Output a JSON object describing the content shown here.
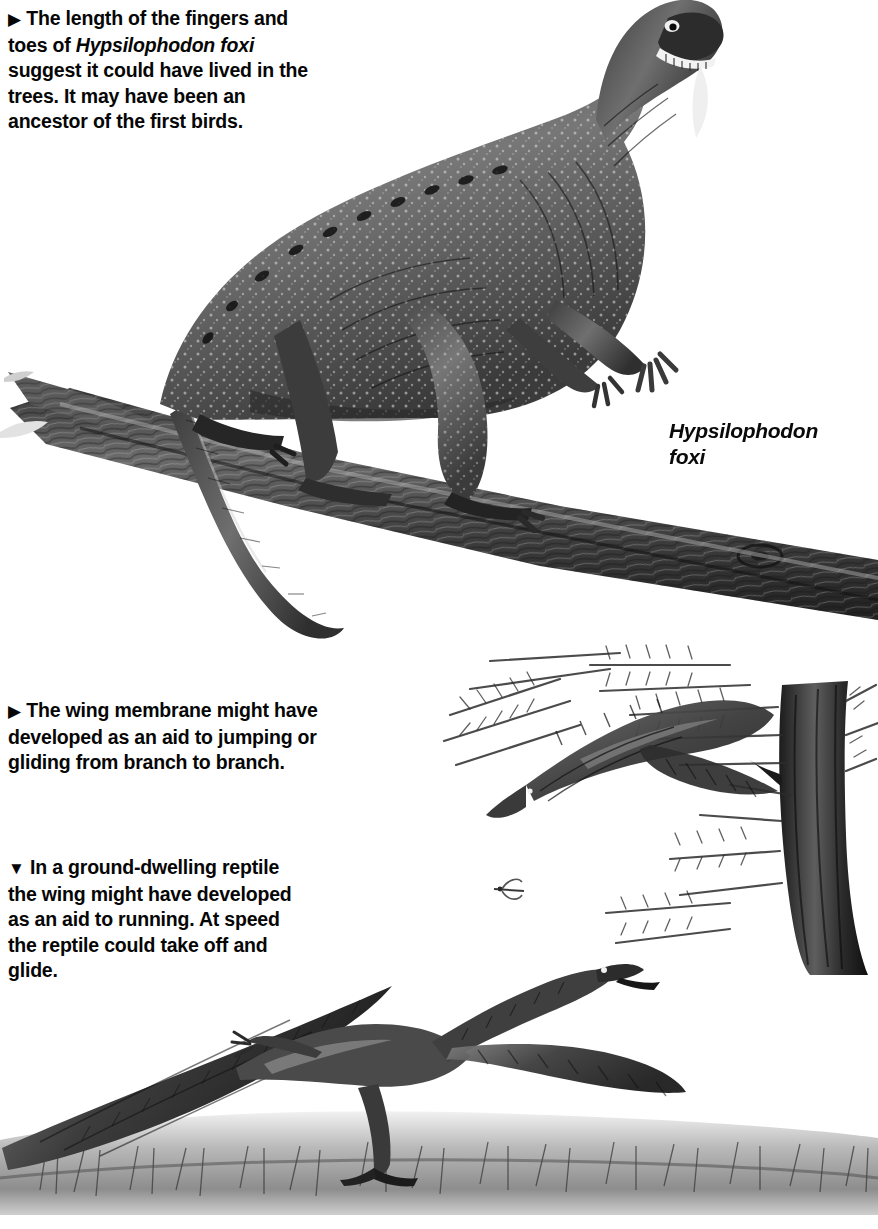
{
  "page": {
    "background_color": "#ffffff",
    "ink_color": "#111111",
    "medium": "grayscale halftone illustration"
  },
  "captions": [
    {
      "id": "cap1",
      "marker": "▶",
      "marker_name": "right-triangle-bullet",
      "text_before_italic": "The length of the fingers and toes of ",
      "italic_text": "Hypsilophodon foxi",
      "text_after_italic": " suggest it could have lived in the trees. It may have been an ancestor of the first birds."
    },
    {
      "id": "cap2",
      "marker": "▶",
      "marker_name": "right-triangle-bullet",
      "text_before_italic": "The wing membrane might have developed as an aid to jumping or gliding from branch to branch.",
      "italic_text": "",
      "text_after_italic": ""
    },
    {
      "id": "cap3",
      "marker": "▼",
      "marker_name": "down-triangle-bullet",
      "text_before_italic": "In a ground-dwelling reptile the wing might have developed as an aid to running. At speed the reptile could take off and glide.",
      "italic_text": "",
      "text_after_italic": ""
    }
  ],
  "species_label": {
    "line1": "Hypsilophodon",
    "line2": "foxi"
  },
  "figures": [
    {
      "name": "hypsilophodon-on-branch",
      "subjects": [
        "Hypsilophodon foxi dinosaur",
        "tree branch",
        "long tail"
      ]
    },
    {
      "name": "gliding-reptile-in-tree",
      "subjects": [
        "gliding reptile with wing membrane",
        "conifer foliage",
        "tree trunk",
        "dragonfly"
      ]
    },
    {
      "name": "running-reptile-on-ground",
      "subjects": [
        "running reptile with wing membranes",
        "grassy ground"
      ]
    }
  ],
  "palette": {
    "ink": "#111111",
    "mid_gray": "#6e6e6e",
    "light_gray": "#b4b4b4",
    "paper": "#ffffff"
  }
}
